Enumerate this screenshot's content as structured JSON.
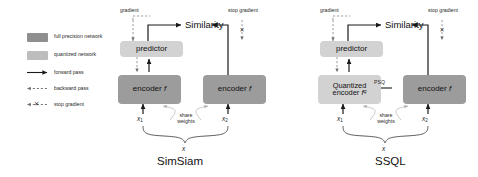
{
  "figure": {
    "caption_left": "SimSiam",
    "caption_right": "SSQL"
  },
  "legend": {
    "items": [
      {
        "name": "full-precision-network",
        "label": "full precision network",
        "kind": "swatch",
        "color": "#8f8f8f"
      },
      {
        "name": "quantized-network",
        "label": "quantized network",
        "kind": "swatch",
        "color": "#bdbdbd"
      },
      {
        "name": "forward-pass",
        "label": "forward pass",
        "kind": "solid-arrow",
        "color": "#1a1a1a"
      },
      {
        "name": "backward-pass",
        "label": "backward pass",
        "kind": "dashed-arrow",
        "color": "#6f6f6f"
      },
      {
        "name": "stop-gradient",
        "label": "stop gradient",
        "kind": "dashed-arrow-x",
        "marker": "✕",
        "color": "#6f6f6f"
      }
    ]
  },
  "simsiam": {
    "gradient_label": "gradient",
    "stop_gradient_label": "stop gradient",
    "similarity_label": "Similarity",
    "predictor_label": "predictor",
    "encoder_left_label": "encoder",
    "encoder_left_symbol": "f",
    "encoder_right_label": "encoder",
    "encoder_right_symbol": "f",
    "input_left": "x",
    "input_left_sub": "1",
    "input_right": "x",
    "input_right_sub": "2",
    "share_weights_line1": "share",
    "share_weights_line2": "weights",
    "source_input": "x",
    "stop_gradient_marker": "✕"
  },
  "ssql": {
    "gradient_label": "gradient",
    "stop_gradient_label": "stop gradient",
    "similarity_label": "Similarity",
    "predictor_label": "predictor",
    "encoder_left_line1": "Quantized",
    "encoder_left_line2": "encoder",
    "encoder_left_symbol": "f",
    "encoder_left_superscript": "q",
    "encoder_right_label": "encoder",
    "encoder_right_symbol": "f",
    "psq_label": "PSQ",
    "input_left": "x",
    "input_left_sub": "1",
    "input_right": "x",
    "input_right_sub": "2",
    "share_weights_line1": "share",
    "share_weights_line2": "weights",
    "source_input": "x",
    "stop_gradient_marker": "✕"
  },
  "colors": {
    "full_precision": "#9c9c9c",
    "quantized": "#d2d2d2",
    "forward": "#1a1a1a",
    "backward": "#6f6f6f",
    "background": "#ffffff"
  }
}
